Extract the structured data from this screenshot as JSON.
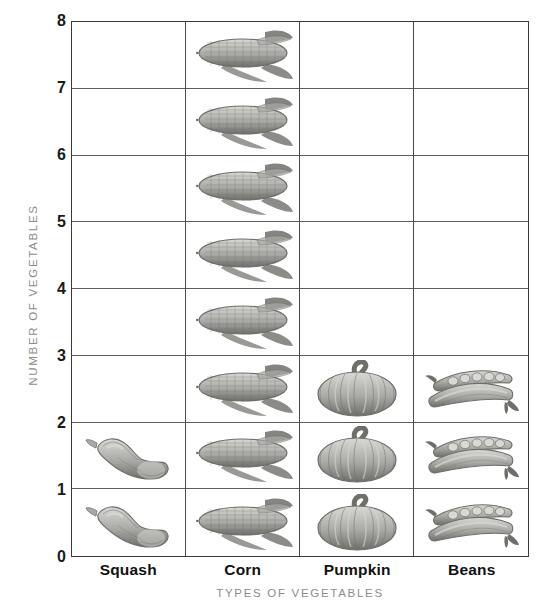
{
  "chart_data": {
    "type": "bar",
    "subtype": "pictograph",
    "title": "",
    "xlabel": "TYPES OF VEGETABLES",
    "ylabel": "NUMBER OF VEGETABLES",
    "categories": [
      "Squash",
      "Corn",
      "Pumpkin",
      "Beans"
    ],
    "values": [
      2,
      8,
      3,
      3
    ],
    "icons": [
      "squash-icon",
      "corn-icon",
      "pumpkin-icon",
      "beans-icon"
    ],
    "ylim": [
      0,
      8
    ],
    "y_ticks": [
      "0",
      "1",
      "2",
      "3",
      "4",
      "5",
      "6",
      "7",
      "8"
    ],
    "grid": true,
    "legend": "none",
    "icon_unit_value": 1,
    "colors": {
      "grid_line": "#5d5d5d",
      "axis_line": "#3a3a3a",
      "tick_label": "#1a1a1a",
      "axis_title": "#8c8c8c",
      "category_label": "#111111",
      "background": "#ffffff",
      "icon_light": "#d8d8d4",
      "icon_mid": "#a9a9a5",
      "icon_dark": "#6e6e6a"
    }
  }
}
